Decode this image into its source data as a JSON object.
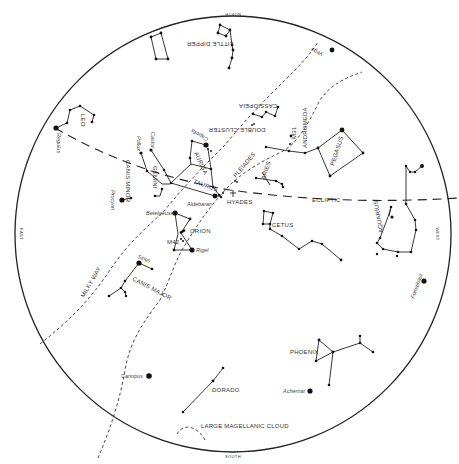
{
  "chart": {
    "horizon": {
      "cx": 233,
      "cy": 234,
      "r": 218
    },
    "directions": {
      "north": "NORTH",
      "south": "SOUTH",
      "east": "EAST",
      "west": "WEST"
    },
    "lines": {
      "ecliptic": "ECLIPTIC",
      "milky_way": "MILKY WAY"
    },
    "constellations": {
      "little_dipper": "LITTLE DIPPER",
      "leo": "LEO",
      "cassiopeia": "CASSIOPEIA",
      "andromeda": "ANDROMEDA",
      "pegasus": "PEGASUS",
      "canis_minor": "CANIS MINOR",
      "gemini": "GEMINI",
      "auriga": "AURIGA",
      "taurus": "TAURUS",
      "aries": "ARIES",
      "orion": "ORION",
      "cetus": "CETUS",
      "aquarius": "AQUARIUS",
      "canis_major": "CANIS MAJOR",
      "phoenix": "PHOENIX",
      "dorado": "DORADO"
    },
    "objects": {
      "double_cluster": "DOUBLE CLUSTER",
      "m31": "M31",
      "pleiades": "PLEIADES",
      "hyades": "HYADES",
      "m42": "M42",
      "lmc": "LARGE MAGELLANIC CLOUD"
    },
    "stars": {
      "vega": "Vega",
      "regulus": "Regulus",
      "castor": "Castor",
      "pollux": "Pollux",
      "capella": "Capella",
      "procyon": "Procyon",
      "aldebaran": "Aldebaran",
      "betelgeuse": "Betelgeuse",
      "rigel": "Rigel",
      "sirius": "Sirius",
      "fomalhaut": "Fomalhaut",
      "canopus": "Canopus",
      "achernar": "Achernar"
    }
  }
}
